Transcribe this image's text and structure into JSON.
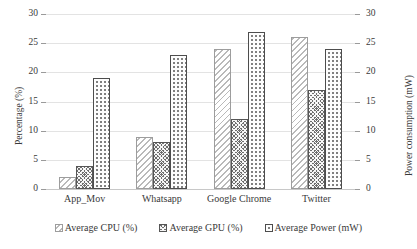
{
  "chart_data": {
    "type": "bar",
    "title": "",
    "categories": [
      "App_Mov",
      "Whatsapp",
      "Google Chrome",
      "Twitter"
    ],
    "series": [
      {
        "name": "Average CPU (%)",
        "values": [
          2,
          9,
          24,
          26
        ],
        "axis": "left",
        "pattern": "diagonal-hatch-light"
      },
      {
        "name": "Average GPU (%)",
        "values": [
          4,
          8,
          12,
          17
        ],
        "axis": "left",
        "pattern": "checkerboard-dark"
      },
      {
        "name": "Average Power (mW)",
        "values": [
          19,
          23,
          27,
          24
        ],
        "axis": "right",
        "pattern": "dots-light"
      }
    ],
    "xlabel": "",
    "ylabel": "Percentage (%)",
    "y2label": "Power consumption (mW)",
    "ylim": [
      0,
      30
    ],
    "y2lim": [
      0,
      30
    ],
    "yticks": [
      0,
      5,
      10,
      15,
      20,
      25,
      30
    ],
    "y2ticks": [
      0,
      5,
      10,
      15,
      20,
      25,
      30
    ],
    "ytick_labels": [
      "0",
      "5",
      "10",
      "15",
      "20",
      "25",
      "30"
    ],
    "y2tick_labels": [
      "0",
      "5",
      "10",
      "15",
      "20",
      "25",
      "30"
    ],
    "grid": true,
    "grid_axis": "y",
    "legend_position": "bottom",
    "legend": [
      "Average CPU (%)",
      "Average GPU (%)",
      "Average Power (mW)"
    ]
  },
  "colors": {
    "gridline": "#e3e3e3",
    "baseline": "#c8c8c8",
    "text": "#3a3a3a",
    "cpu_outline": "#9d9d9d",
    "gpu_fill": "#6e6e6e",
    "power_outline": "#4d4d4d",
    "background": "#ffffff"
  }
}
